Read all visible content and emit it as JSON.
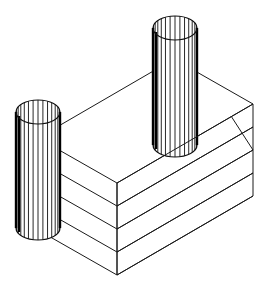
{
  "diagram": {
    "type": "isometric-wireframe",
    "colors": {
      "background": "#ffffff",
      "line": "#1a1a1a"
    },
    "block": {
      "layers": 4,
      "front_corner_bottom": [
        117,
        275
      ],
      "layer_step_px": 23,
      "right_face_dx": 136,
      "right_face_dy": -79,
      "left_face_dx": -79,
      "left_face_dy": -45
    },
    "cylinders": [
      {
        "name": "right-cylinder",
        "cx": 175,
        "top_cy": 28,
        "bottom_cy": 145,
        "rx": 22,
        "ry": 12,
        "hatch_lines": 14
      },
      {
        "name": "left-cylinder",
        "cx": 38,
        "top_cy": 112,
        "bottom_cy": 228,
        "rx": 22,
        "ry": 12,
        "hatch_lines": 14
      }
    ]
  }
}
